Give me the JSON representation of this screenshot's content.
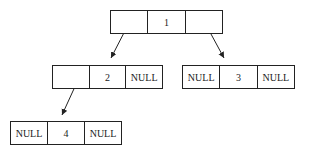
{
  "diagram": {
    "type": "binary-tree-linked-representation",
    "nodes": [
      {
        "id": "n1",
        "cells": [
          "",
          "1",
          ""
        ]
      },
      {
        "id": "n2",
        "cells": [
          "",
          "2",
          "NULL"
        ]
      },
      {
        "id": "n3",
        "cells": [
          "NULL",
          "3",
          "NULL"
        ]
      },
      {
        "id": "n4",
        "cells": [
          "NULL",
          "4",
          "NULL"
        ]
      }
    ],
    "edges": [
      {
        "from": "n1",
        "pointer": "left",
        "to": "n2"
      },
      {
        "from": "n1",
        "pointer": "right",
        "to": "n3"
      },
      {
        "from": "n2",
        "pointer": "left",
        "to": "n4"
      }
    ],
    "colors": {
      "stroke": "#222222",
      "background": "#ffffff"
    }
  }
}
